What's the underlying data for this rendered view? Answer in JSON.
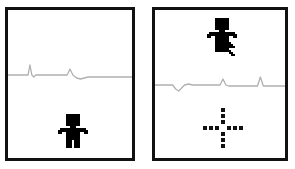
{
  "scene": {
    "title": "Two-panel pixel game frames with ECG-style waveform",
    "background_color": "#ffffff",
    "border_color": "#111111",
    "waveform_color": "#b0b0b0",
    "figure_color": "#000000",
    "crosshair_color": "#111111",
    "cursor_color": "#000000"
  },
  "panels": [
    {
      "id": "panel-left",
      "name": "left-frame",
      "label": "Left frame",
      "waveform": {
        "name": "ecg-waveform-left",
        "label": "ECG waveform",
        "color": "#b0b0b0",
        "baseline": 0.62,
        "points": "0,15 18,15 21,15 23,5 25,15 27,17 29,15 58,15 62,15 65,9 68,15 72,18 76,19 80,18 84,17 120,17 130,17"
      },
      "figure": {
        "name": "pixel-character-left",
        "label": "Pixel character",
        "color": "#000000",
        "pose": "standing",
        "position": {
          "x": 50,
          "y": 104
        }
      },
      "crosshair": null,
      "cursor": null
    },
    {
      "id": "panel-right",
      "name": "right-frame",
      "label": "Right frame",
      "waveform": {
        "name": "ecg-waveform-right",
        "label": "ECG waveform",
        "color": "#b0b0b0",
        "baseline": 0.62,
        "points": "0,15 14,15 18,15 21,19 24,21 27,18 30,15 34,14 38,15 62,15 66,15 69,9 72,15 75,16 100,16 104,16 107,7 110,16 113,16 132,16"
      },
      "figure": {
        "name": "pixel-character-right",
        "label": "Pixel character",
        "color": "#000000",
        "pose": "standing",
        "position": {
          "x": 52,
          "y": 8
        }
      },
      "crosshair": {
        "name": "dashed-crosshair-icon",
        "label": "Dashed crosshair marker",
        "color": "#111111",
        "position": {
          "x": 48,
          "y": 98
        }
      },
      "cursor": {
        "name": "mouse-cursor-icon",
        "label": "Mouse cursor",
        "color": "#000000",
        "position": {
          "x": 66,
          "y": 24
        }
      }
    }
  ]
}
